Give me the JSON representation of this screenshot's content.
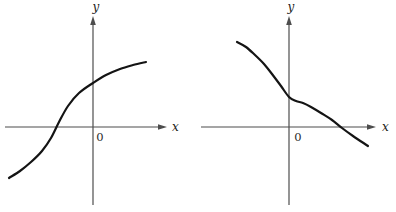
{
  "page": {
    "background": "#ffffff"
  },
  "chart_data": [
    {
      "type": "line",
      "title": "",
      "xlabel": "x",
      "ylabel": "y",
      "origin_label": "0",
      "description": "Qualitative sketch of an increasing S-shaped function (concave up, inflection near the x-intercept left of origin, then concave down, leveling off at upper right). Crosses x-axis at about -36 px left of origin and y-axis at about +44 px above origin. No tick marks or grid.",
      "legend": "none",
      "grid": false,
      "colors": {
        "axis": "#4d4d4d",
        "curve": "#141414",
        "background": "#ffffff"
      },
      "panel_px": {
        "width": 198,
        "height": 212
      },
      "axes_px": {
        "y_axis_x": 93,
        "y_top": 16,
        "y_bottom": 205,
        "x_axis_y": 127,
        "x_left": 5,
        "x_right": 167
      },
      "labels_px": {
        "y": {
          "x": 96,
          "y": 11,
          "anchor": "middle"
        },
        "x": {
          "x": 172,
          "y": 131,
          "anchor": "start"
        },
        "origin": {
          "x": 100,
          "y": 141,
          "anchor": "middle"
        }
      },
      "curve_points_px": [
        [
          9,
          178
        ],
        [
          20,
          171
        ],
        [
          31,
          162
        ],
        [
          42,
          151
        ],
        [
          51,
          138
        ],
        [
          59,
          122
        ],
        [
          68,
          106
        ],
        [
          79,
          93
        ],
        [
          93,
          83
        ],
        [
          106,
          75
        ],
        [
          120,
          69
        ],
        [
          133,
          65
        ],
        [
          146,
          62
        ]
      ]
    },
    {
      "type": "line",
      "title": "",
      "xlabel": "x",
      "ylabel": "y",
      "origin_label": "0",
      "description": "Qualitative sketch of a decreasing function starting at upper left, steepening downward, with a brief flattening (inflection plateau) just right of the y-axis, then decreasing again and crossing the x-axis at about +53 px right of origin, ending below the axis. No tick marks or grid.",
      "legend": "none",
      "grid": false,
      "colors": {
        "axis": "#4d4d4d",
        "curve": "#141414",
        "background": "#ffffff"
      },
      "panel_px": {
        "width": 198,
        "height": 212
      },
      "axes_px": {
        "y_axis_x": 91,
        "y_top": 16,
        "y_bottom": 205,
        "x_axis_y": 127,
        "x_left": 3,
        "x_right": 178
      },
      "labels_px": {
        "y": {
          "x": 93,
          "y": 11,
          "anchor": "middle"
        },
        "x": {
          "x": 184,
          "y": 131,
          "anchor": "start"
        },
        "origin": {
          "x": 100,
          "y": 141,
          "anchor": "middle"
        }
      },
      "curve_points_px": [
        [
          39,
          42
        ],
        [
          48,
          47
        ],
        [
          57,
          55
        ],
        [
          66,
          64
        ],
        [
          74,
          74
        ],
        [
          83,
          86
        ],
        [
          91,
          97
        ],
        [
          98,
          101
        ],
        [
          105,
          103
        ],
        [
          113,
          107
        ],
        [
          123,
          113
        ],
        [
          134,
          120
        ],
        [
          144,
          128
        ],
        [
          155,
          136
        ],
        [
          170,
          146
        ]
      ]
    }
  ]
}
